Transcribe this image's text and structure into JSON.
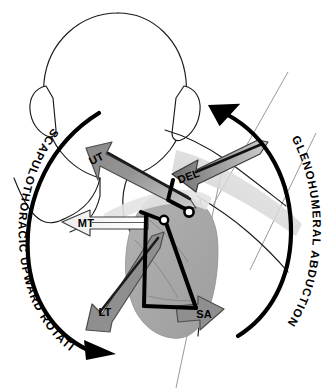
{
  "figure": {
    "view": "posterior view of head, neck, shoulder girdle and upper arm"
  },
  "colors": {
    "background": "#ffffff",
    "outline": "#1a1a1a",
    "bone_linkage": "#000000",
    "joint_marker_fill": "#ffffff",
    "scapula_fill": "#a9a9a9",
    "arm_fill": "#b4b4b4",
    "arrow_mid_gray": "#8c8c8c",
    "arrow_dark_gray": "#6e6e6e",
    "arrow_light": "#f2f2f2",
    "reference_line": "#9a9a9a",
    "arc_stroke": "#000000"
  },
  "arcs": [
    {
      "id": "scapulothoracic",
      "label": "SCAPULOTHORACIC UPWARD ROTATION",
      "side": "left",
      "direction": "clockwise, arrowhead at lower right"
    },
    {
      "id": "glenohumeral",
      "label": "GLENOHUMERAL ABDUCTION",
      "side": "right",
      "direction": "counter-clockwise, arrowhead at upper left"
    }
  ],
  "muscles": [
    {
      "abbr": "UT",
      "name": "upper trapezius",
      "direction": "superomedial (up and to the left)",
      "fill": "#8c8c8c"
    },
    {
      "abbr": "MT",
      "name": "middle trapezius",
      "direction": "medial (horizontally to the left)",
      "fill": "#f2f2f2"
    },
    {
      "abbr": "LT",
      "name": "lower trapezius",
      "direction": "inferomedial (down and to the left)",
      "fill": "#8c8c8c"
    },
    {
      "abbr": "SA",
      "name": "serratus anterior",
      "direction": "lateral (to the right)",
      "fill": "#8c8c8c"
    },
    {
      "abbr": "DEL",
      "name": "deltoid",
      "direction": "inferomedial along the humerus (down and to the left)",
      "fill": "#6e6e6e"
    }
  ],
  "joints": [
    {
      "id": "acromioclavicular",
      "note": "white circle marker on bone linkage"
    },
    {
      "id": "glenohumeral",
      "note": "white circle marker at humeral head"
    }
  ]
}
